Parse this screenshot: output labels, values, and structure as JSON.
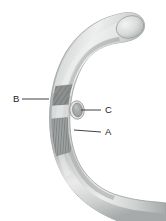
{
  "figure": {
    "background_color": "#ffffff",
    "width": 166,
    "height": 221
  },
  "object": {
    "name": "curved-tube",
    "shape": "C-shaped arc tube",
    "body_light_color": "#e9eaea",
    "body_mid_color": "#c9cbcb",
    "body_shadow_color": "#a3a6a6",
    "outline_color": "#9a9d9d"
  },
  "regions": [
    {
      "id": "B",
      "name": "upper-hatched-band",
      "hatch_direction": "diagonal",
      "fill_color": "#8f9292",
      "hatch_color": "#6d7070"
    },
    {
      "id": "A",
      "name": "lower-hatched-band",
      "hatch_direction": "vertical",
      "fill_color": "#9a9d9d",
      "hatch_color": "#6d7070"
    },
    {
      "id": "C",
      "name": "oval-opening",
      "fill_color": "#a8abab",
      "rim_color": "#7e8181"
    }
  ],
  "labels": [
    {
      "id": "label-b",
      "text": "B",
      "x": 13,
      "y": 102,
      "leader_from_x": 22,
      "leader_from_y": 99,
      "leader_to_x": 49,
      "leader_to_y": 99
    },
    {
      "id": "label-c",
      "text": "C",
      "x": 105,
      "y": 113,
      "leader_from_x": 101,
      "leader_from_y": 110,
      "leader_to_x": 80,
      "leader_to_y": 110
    },
    {
      "id": "label-a",
      "text": "A",
      "x": 105,
      "y": 135,
      "leader_from_x": 101,
      "leader_from_y": 132,
      "leader_to_x": 76,
      "leader_to_y": 132
    }
  ],
  "colors": {
    "label_text": "#1a1a1a",
    "leader_line": "#2b2b2b"
  }
}
